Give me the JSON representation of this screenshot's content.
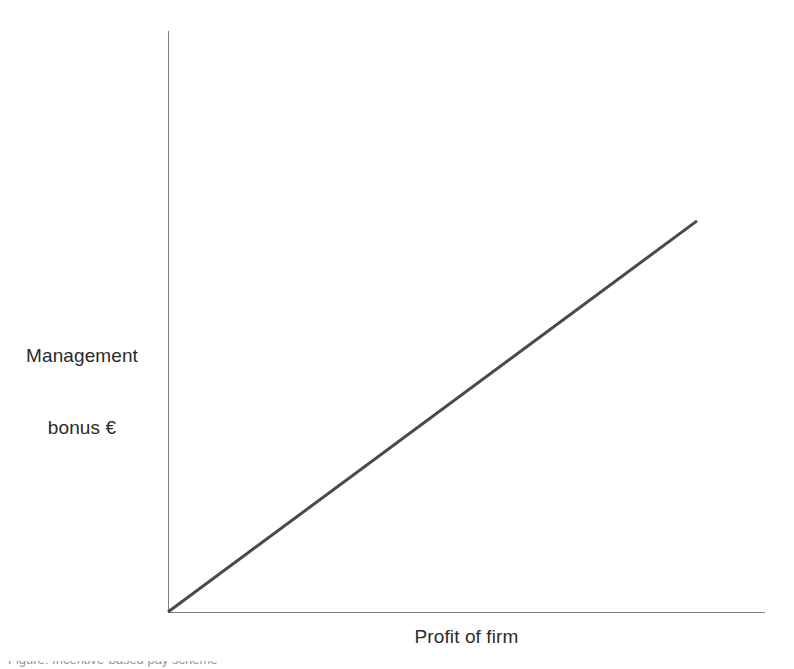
{
  "figure": {
    "background_color": "#ffffff",
    "width": 794,
    "height": 669,
    "caption_partial": "Figure: Incentive-based pay scheme"
  },
  "axes": {
    "color": "#808080",
    "line_width": 1.5,
    "y_axis": {
      "x": 168,
      "y_top": 31,
      "y_bottom": 612
    },
    "x_axis": {
      "y": 612,
      "x_left": 168,
      "x_right": 765
    }
  },
  "labels": {
    "y_axis_line1": "Management",
    "y_axis_line2": "bonus €",
    "x_axis": "Profit of firm"
  },
  "chart_data": {
    "type": "line",
    "title": "",
    "subtitle": "",
    "xlabel": "Profit of firm",
    "ylabel": "Management bonus €",
    "xlim": [
      0,
      100
    ],
    "ylim": [
      0,
      100
    ],
    "grid": false,
    "legend": false,
    "legend_position": "none",
    "axis_ticks": false,
    "tick_labels": {
      "x": [],
      "y": []
    },
    "annotations": [],
    "series": [
      {
        "name": "Management bonus",
        "color": "#4a4a4a",
        "line_width": 3,
        "style": "solid",
        "x": [
          0,
          100
        ],
        "y": [
          0,
          82
        ],
        "description": "Straight upward-sloping line from the origin, showing management bonus rising in direct proportion to firm profit"
      }
    ]
  }
}
